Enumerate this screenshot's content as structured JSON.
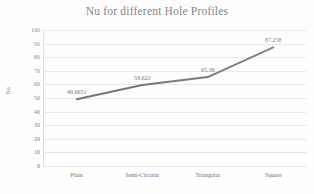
{
  "chart_data": {
    "type": "line",
    "title": "Nu for different Hole Profiles",
    "xlabel": "",
    "ylabel": "Nu",
    "categories": [
      "Plain",
      "Semi-Circular",
      "Triangular",
      "Square"
    ],
    "values": [
      49.0651,
      59.622,
      65.38,
      87.258
    ],
    "data_labels": [
      "49.0651",
      "59.622",
      "65.38",
      "87.258"
    ],
    "ylim": [
      0,
      100
    ],
    "ytick_step": 10,
    "yticks": [
      "100",
      "90",
      "80",
      "70",
      "60",
      "50",
      "40",
      "30",
      "20",
      "10",
      "0"
    ],
    "grid": true,
    "legend": false,
    "legend_position": "none",
    "series": [
      {
        "name": "Nu",
        "values": [
          49.0651,
          59.622,
          65.38,
          87.258
        ],
        "color": "#595959",
        "marker": "none",
        "line_width": 2
      }
    ],
    "colors": {
      "line": "#595959",
      "gridline": "#e4e4e4",
      "axis": "#d8d8d8",
      "title_text": "#4a4a4a",
      "tick_text": "#6e6e6e",
      "label_text": "#555555",
      "background": "#fefefe"
    }
  }
}
